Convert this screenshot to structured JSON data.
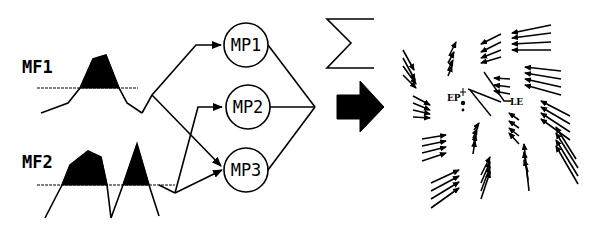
{
  "figure": {
    "membership_functions": [
      {
        "id": "mf1",
        "label": "MF1"
      },
      {
        "id": "mf2",
        "label": "MF2"
      }
    ],
    "motor_primitives": [
      {
        "id": "mp1",
        "label": "MP1"
      },
      {
        "id": "mp2",
        "label": "MP2"
      },
      {
        "id": "mp3",
        "label": "MP3"
      }
    ],
    "summation_symbol": "Σ",
    "arrow_icon": "right-arrow-icon",
    "field_labels": {
      "ep": "EP",
      "le": "LE"
    },
    "colors": {
      "ink": "#000000",
      "background": "#ffffff"
    }
  }
}
